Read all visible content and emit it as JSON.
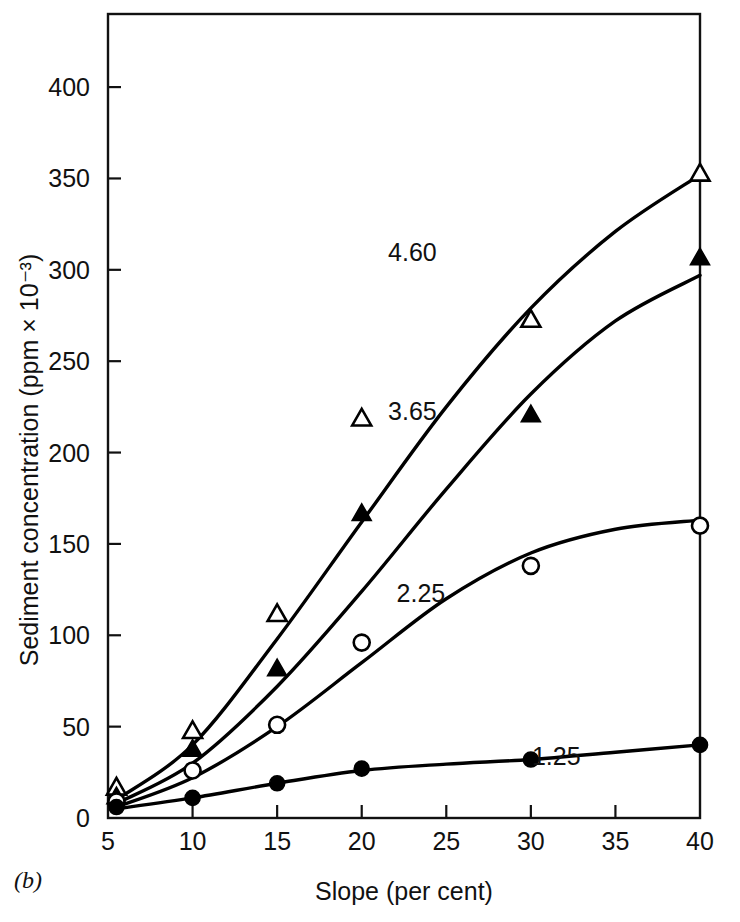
{
  "figure": {
    "panel_label": "(b)"
  },
  "chart_data": {
    "type": "scatter",
    "title": "",
    "subtitle": "",
    "xlabel": "Slope (per cent)",
    "ylabel": "Sediment concentration (ppm × 10⁻³)",
    "xlim": [
      5,
      40
    ],
    "ylim": [
      0,
      440
    ],
    "xticks": [
      5,
      10,
      15,
      20,
      25,
      30,
      35,
      40
    ],
    "xtick_labels": [
      "5",
      "10",
      "15",
      "20",
      "25",
      "30",
      "35",
      "40"
    ],
    "yticks": [
      0,
      50,
      100,
      150,
      200,
      250,
      300,
      350,
      400
    ],
    "ytick_labels": [
      "0",
      "50",
      "100",
      "150",
      "200",
      "250",
      "300",
      "350",
      "400"
    ],
    "grid": false,
    "legend_position": "inline-curve-labels",
    "frame": "box",
    "series": [
      {
        "name": "4.60",
        "label": "4.60",
        "marker": "open-triangle",
        "label_x": 23.0,
        "label_y": 305,
        "x": [
          5.5,
          10,
          15,
          20,
          30,
          40
        ],
        "values": [
          17,
          48,
          112,
          219,
          273,
          353
        ],
        "curve_x": [
          5.5,
          10,
          15,
          20,
          25,
          30,
          35,
          40
        ],
        "curve_y": [
          10,
          40,
          98,
          162,
          225,
          279,
          321,
          352
        ]
      },
      {
        "name": "3.65",
        "label": "3.65",
        "marker": "filled-triangle",
        "label_x": 23.0,
        "label_y": 218,
        "x": [
          5.5,
          10,
          15,
          20,
          30,
          40
        ],
        "values": [
          12,
          38,
          82,
          167,
          221,
          307
        ],
        "curve_x": [
          5.5,
          10,
          15,
          20,
          25,
          30,
          35,
          40
        ],
        "curve_y": [
          8,
          30,
          72,
          124,
          180,
          232,
          272,
          297
        ]
      },
      {
        "name": "2.25",
        "label": "2.25",
        "marker": "open-circle",
        "label_x": 23.5,
        "label_y": 118,
        "x": [
          5.5,
          10,
          15,
          20,
          30,
          40
        ],
        "values": [
          9,
          26,
          51,
          96,
          138,
          160
        ],
        "curve_x": [
          5.5,
          10,
          15,
          20,
          25,
          30,
          35,
          40
        ],
        "curve_y": [
          6,
          22,
          50,
          85,
          120,
          145,
          158,
          163
        ]
      },
      {
        "name": "1.25",
        "label": "1.25",
        "marker": "filled-circle",
        "label_x": 31.5,
        "label_y": 29,
        "x": [
          5.5,
          10,
          15,
          20,
          30,
          40
        ],
        "values": [
          6,
          11,
          19,
          27,
          32,
          40
        ],
        "curve_x": [
          5.5,
          10,
          15,
          20,
          25,
          30,
          35,
          40
        ],
        "curve_y": [
          5,
          11,
          19,
          26,
          29.5,
          32,
          36,
          40
        ]
      }
    ]
  }
}
